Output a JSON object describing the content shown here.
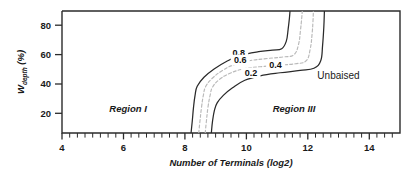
{
  "figure": {
    "background_color": "#ffffff",
    "axis_color": "#2b2b2b"
  },
  "chart_data": {
    "type": "line",
    "title": "",
    "subtitle": "",
    "xlabel": "Number of Terminals (log2)",
    "ylabel": "W_depth (%)",
    "ylabel_base": "W",
    "ylabel_sub": "depth",
    "ylabel_unit": "(%)",
    "xlim": [
      4,
      15
    ],
    "ylim": [
      10,
      91
    ],
    "grid": false,
    "legend_position": "none",
    "x_major_ticks": [
      4,
      6,
      8,
      10,
      12,
      14
    ],
    "x_tick_labels": [
      "4",
      "6",
      "8",
      "10",
      "12",
      "14"
    ],
    "x_minor_tick_step": 0.25,
    "y_major_ticks": [
      20,
      40,
      60,
      80
    ],
    "y_tick_labels": [
      "20",
      "40",
      "60",
      "80"
    ],
    "series": [
      {
        "name": "0.8",
        "style": "solid",
        "color": "#2a2a2a",
        "label": "0.8",
        "label_x": 9.75,
        "label_y": 63.5,
        "points": [
          [
            8.2,
            10.0
          ],
          [
            8.24,
            18.0
          ],
          [
            8.28,
            27.0
          ],
          [
            8.33,
            35.0
          ],
          [
            8.4,
            41.0
          ],
          [
            8.62,
            47.0
          ],
          [
            8.95,
            52.5
          ],
          [
            9.35,
            57.5
          ],
          [
            9.8,
            61.5
          ],
          [
            10.4,
            64.0
          ],
          [
            10.85,
            65.0
          ],
          [
            11.15,
            66.0
          ],
          [
            11.3,
            71.0
          ],
          [
            11.36,
            79.0
          ],
          [
            11.4,
            86.0
          ],
          [
            11.42,
            91.0
          ]
        ]
      },
      {
        "name": "0.6",
        "style": "dashed-faint",
        "color": "#b9b9b9",
        "label": "0.6",
        "label_x": 9.8,
        "label_y": 58.5,
        "points": [
          [
            8.45,
            10.0
          ],
          [
            8.49,
            18.0
          ],
          [
            8.54,
            27.0
          ],
          [
            8.6,
            35.0
          ],
          [
            8.68,
            41.0
          ],
          [
            8.9,
            46.5
          ],
          [
            9.22,
            51.5
          ],
          [
            9.62,
            55.5
          ],
          [
            10.1,
            58.0
          ],
          [
            10.7,
            59.5
          ],
          [
            11.2,
            60.5
          ],
          [
            11.55,
            62.0
          ],
          [
            11.7,
            69.0
          ],
          [
            11.76,
            78.0
          ],
          [
            11.8,
            86.0
          ],
          [
            11.82,
            91.0
          ]
        ]
      },
      {
        "name": "0.4",
        "style": "dashed-faint",
        "color": "#b9b9b9",
        "label": "0.4",
        "label_x": 10.95,
        "label_y": 55.0,
        "points": [
          [
            8.66,
            10.0
          ],
          [
            8.7,
            18.0
          ],
          [
            8.75,
            27.0
          ],
          [
            8.82,
            35.0
          ],
          [
            8.9,
            40.5
          ],
          [
            9.12,
            45.5
          ],
          [
            9.45,
            49.5
          ],
          [
            9.9,
            52.5
          ],
          [
            10.45,
            54.0
          ],
          [
            11.05,
            55.0
          ],
          [
            11.6,
            56.0
          ],
          [
            11.95,
            58.0
          ],
          [
            12.08,
            66.0
          ],
          [
            12.14,
            76.0
          ],
          [
            12.17,
            85.0
          ],
          [
            12.18,
            91.0
          ]
        ]
      },
      {
        "name": "0.2",
        "style": "solid",
        "color": "#2a2a2a",
        "label": "0.2",
        "label_x": 10.15,
        "label_y": 50.0,
        "points": [
          [
            8.86,
            10.0
          ],
          [
            8.9,
            18.0
          ],
          [
            8.96,
            25.0
          ],
          [
            9.05,
            30.0
          ],
          [
            9.25,
            35.0
          ],
          [
            9.55,
            40.0
          ],
          [
            9.95,
            45.0
          ],
          [
            10.45,
            48.0
          ],
          [
            11.1,
            50.0
          ],
          [
            11.75,
            51.5
          ],
          [
            12.2,
            53.0
          ],
          [
            12.42,
            58.0
          ],
          [
            12.48,
            68.0
          ],
          [
            12.52,
            80.0
          ],
          [
            12.54,
            91.0
          ]
        ]
      }
    ],
    "annotations": [
      {
        "text": "Region I",
        "x": 6.15,
        "y": 26.0,
        "style": "italic",
        "name": "region-i-label"
      },
      {
        "text": "Region III",
        "x": 11.55,
        "y": 26.0,
        "style": "italic",
        "name": "region-iii-label"
      },
      {
        "text": "Unbaised",
        "x": 13.0,
        "y": 48.0,
        "style": "plain",
        "name": "unbaised-label"
      }
    ]
  }
}
